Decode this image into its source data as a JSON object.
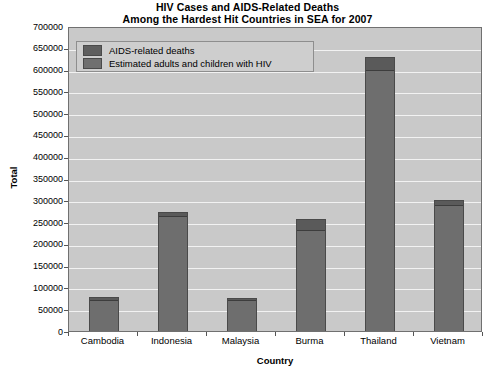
{
  "chart_data": {
    "type": "bar",
    "title": "HIV Cases and AIDS-Related Deaths Among the Hardest Hit Countries in SEA for 2007",
    "title_line1": "HIV Cases and AIDS-Related Deaths",
    "title_line2": "Among the Hardest Hit Countries in SEA for 2007",
    "xlabel": "Country",
    "ylabel": "Total",
    "categories": [
      "Cambodia",
      "Indonesia",
      "Malaysia",
      "Burma",
      "Thailand",
      "Vietnam"
    ],
    "ylim": [
      0,
      700000
    ],
    "ytick_labels": [
      "700000",
      "650000",
      "600000",
      "550000",
      "500000",
      "450000",
      "400000",
      "350000",
      "300000",
      "250000",
      "200000",
      "150000",
      "100000",
      "50000",
      "0"
    ],
    "ytick_values": [
      700000,
      650000,
      600000,
      550000,
      500000,
      450000,
      400000,
      350000,
      300000,
      250000,
      200000,
      150000,
      100000,
      50000,
      0
    ],
    "ytick_step": 50000,
    "grid": true,
    "stacked": true,
    "legend_position": "upper-left-inside",
    "series": [
      {
        "name": "AIDS-related deaths",
        "color": "#5a5a5a",
        "values": [
          6900,
          8700,
          4600,
          25000,
          30000,
          13000
        ]
      },
      {
        "name": "Estimated adults and children with HIV",
        "color": "#6e6e6e",
        "values": [
          75000,
          268000,
          76000,
          237000,
          604000,
          293000
        ]
      }
    ],
    "totals": [
      81900,
      276700,
      80600,
      262000,
      634000,
      306000
    ],
    "annotations": []
  },
  "legend": {
    "items": [
      {
        "label": "AIDS-related deaths",
        "color": "#5a5a5a"
      },
      {
        "label": "Estimated adults and children with HIV",
        "color": "#6e6e6e"
      }
    ]
  },
  "colors": {
    "plot_background": "#c9c9c9",
    "gridline": "#f2f2f2",
    "axis": "#707070",
    "bar_main": "#6e6e6e",
    "bar_top": "#5a5a5a",
    "bar_border": "#4a4a4a",
    "page_background": "#ffffff",
    "text": "#000000"
  }
}
